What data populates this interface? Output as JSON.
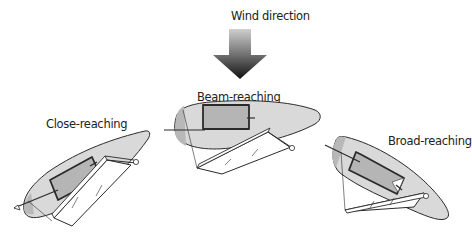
{
  "diagram": {
    "wind": {
      "label": "Wind direction",
      "icon": "down-arrow-icon",
      "gradient_top": "#c8c8c8",
      "gradient_bottom": "#1a1a1a"
    },
    "boats": [
      {
        "label": "Close-reaching",
        "heading": "up-right, close to wind"
      },
      {
        "label": "Beam-reaching",
        "heading": "right, perpendicular to wind"
      },
      {
        "label": "Broad-reaching",
        "heading": "down-right, wind from behind quarter"
      }
    ],
    "colors": {
      "hull_fill": "#d9d9d9",
      "hull_stroke": "#333333",
      "cockpit_fill": "#b5b5b5",
      "sail_fill": "#ffffff",
      "outline": "#222222"
    }
  }
}
